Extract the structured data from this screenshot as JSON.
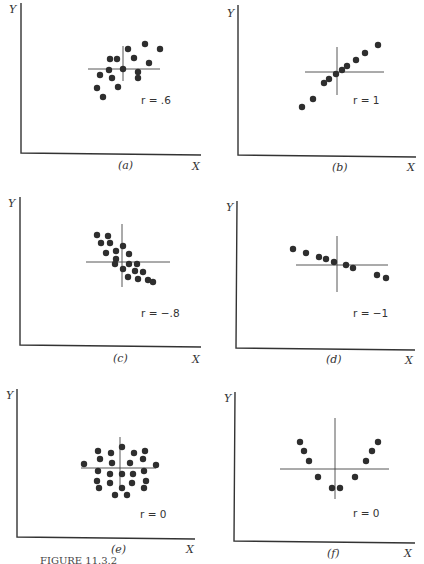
{
  "figure": {
    "caption": "FIGURE 11.3.2  Scatter diagrams illustrating various values of r",
    "caption_visible": "FIGURE 11.3.2"
  },
  "chart_data": [
    {
      "type": "scatter",
      "panel": "(a)",
      "xlabel": "X",
      "ylabel": "Y",
      "annotation": "r = .6",
      "crosshair": {
        "h": [
          88,
          160,
          69
        ],
        "v": [
          123,
          46,
          81
        ]
      },
      "points": [
        [
          128,
          49
        ],
        [
          145,
          44
        ],
        [
          160,
          49
        ],
        [
          110,
          59
        ],
        [
          117,
          59
        ],
        [
          134,
          58
        ],
        [
          149,
          63
        ],
        [
          109,
          70
        ],
        [
          123,
          69
        ],
        [
          138,
          72
        ],
        [
          100,
          75
        ],
        [
          112,
          78
        ],
        [
          138,
          78
        ],
        [
          118,
          87
        ],
        [
          97,
          88
        ],
        [
          103,
          97
        ]
      ]
    },
    {
      "type": "scatter",
      "panel": "(b)",
      "xlabel": "X",
      "ylabel": "Y",
      "annotation": "r = 1",
      "crosshair": {
        "h": [
          305,
          384,
          72
        ],
        "v": [
          337,
          47,
          95
        ]
      },
      "points": [
        [
          302,
          107
        ],
        [
          313,
          99
        ],
        [
          324,
          83
        ],
        [
          329,
          79
        ],
        [
          336,
          74
        ],
        [
          342,
          70
        ],
        [
          347,
          66
        ],
        [
          356,
          60
        ],
        [
          365,
          53
        ],
        [
          378,
          45
        ]
      ]
    },
    {
      "type": "scatter",
      "panel": "(c)",
      "xlabel": "X",
      "ylabel": "Y",
      "annotation": "r = −.8",
      "crosshair": {
        "h": [
          86,
          170,
          262
        ],
        "v": [
          122,
          224,
          287
        ]
      },
      "points": [
        [
          97,
          235
        ],
        [
          108,
          236
        ],
        [
          101,
          243
        ],
        [
          110,
          243
        ],
        [
          123,
          246
        ],
        [
          106,
          253
        ],
        [
          116,
          251
        ],
        [
          129,
          254
        ],
        [
          116,
          259
        ],
        [
          115,
          264
        ],
        [
          129,
          264
        ],
        [
          137,
          264
        ],
        [
          123,
          269
        ],
        [
          143,
          272
        ],
        [
          135,
          271
        ],
        [
          128,
          277
        ],
        [
          138,
          279
        ],
        [
          148,
          280
        ],
        [
          153,
          282
        ]
      ]
    },
    {
      "type": "scatter",
      "panel": "(d)",
      "xlabel": "X",
      "ylabel": "Y",
      "annotation": "r = −1",
      "crosshair": {
        "h": [
          296,
          388,
          265
        ],
        "v": [
          337,
          236,
          292
        ]
      },
      "points": [
        [
          293,
          249
        ],
        [
          306,
          253
        ],
        [
          319,
          257
        ],
        [
          326,
          259
        ],
        [
          334,
          262
        ],
        [
          346,
          265
        ],
        [
          353,
          268
        ],
        [
          377,
          275
        ],
        [
          386,
          278
        ]
      ]
    },
    {
      "type": "scatter",
      "panel": "(e)",
      "xlabel": "X",
      "ylabel": "Y",
      "annotation": "r = 0",
      "crosshair": {
        "h": [
          81,
          156,
          468
        ],
        "v": [
          120,
          437,
          490
        ]
      },
      "points": [
        [
          98,
          451
        ],
        [
          111,
          453
        ],
        [
          122,
          447
        ],
        [
          134,
          453
        ],
        [
          145,
          451
        ],
        [
          100,
          459
        ],
        [
          112,
          463
        ],
        [
          130,
          463
        ],
        [
          143,
          459
        ],
        [
          84,
          464
        ],
        [
          156,
          465
        ],
        [
          98,
          471
        ],
        [
          110,
          474
        ],
        [
          122,
          474
        ],
        [
          133,
          474
        ],
        [
          144,
          471
        ],
        [
          97,
          481
        ],
        [
          110,
          483
        ],
        [
          122,
          488
        ],
        [
          132,
          483
        ],
        [
          146,
          481
        ],
        [
          99,
          488
        ],
        [
          144,
          488
        ],
        [
          115,
          495
        ],
        [
          127,
          495
        ]
      ]
    },
    {
      "type": "scatter",
      "panel": "(f)",
      "xlabel": "X",
      "ylabel": "Y",
      "annotation": "r = 0",
      "crosshair": {
        "h": [
          280,
          389,
          469
        ],
        "v": [
          335,
          418,
          499
        ]
      },
      "points": [
        [
          300,
          442
        ],
        [
          304,
          451
        ],
        [
          309,
          461
        ],
        [
          318,
          477
        ],
        [
          332,
          488
        ],
        [
          340,
          488
        ],
        [
          355,
          477
        ],
        [
          366,
          461
        ],
        [
          372,
          451
        ],
        [
          378,
          442
        ]
      ]
    }
  ],
  "panels": {
    "a": {
      "label": "(a)",
      "x_axis": "X",
      "y_axis": "Y",
      "r_text": "r = .6"
    },
    "b": {
      "label": "(b)",
      "x_axis": "X",
      "y_axis": "Y",
      "r_text": "r = 1"
    },
    "c": {
      "label": "(c)",
      "x_axis": "X",
      "y_axis": "Y",
      "r_text": "r = −.8"
    },
    "d": {
      "label": "(d)",
      "x_axis": "X",
      "y_axis": "Y",
      "r_text": "r = −1"
    },
    "e": {
      "label": "(e)",
      "x_axis": "X",
      "y_axis": "Y",
      "r_text": "r = 0"
    },
    "f": {
      "label": "(f)",
      "x_axis": "X",
      "y_axis": "Y",
      "r_text": "r = 0"
    }
  }
}
